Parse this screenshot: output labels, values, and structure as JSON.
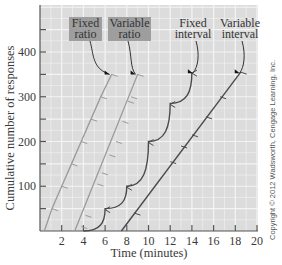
{
  "chart_data": {
    "type": "line",
    "title": "",
    "xlabel": "Time (minutes)",
    "ylabel": "Cumulative number of responses",
    "xlim": [
      0,
      20
    ],
    "ylim": [
      0,
      500
    ],
    "xticks": [
      2,
      4,
      6,
      8,
      10,
      12,
      14,
      16,
      18,
      20
    ],
    "yticks": [
      100,
      200,
      300,
      400
    ],
    "yticks_minor": [
      50,
      150,
      250,
      350,
      450
    ],
    "grid": true,
    "legend_position": "top-inside, labels with arrows",
    "series": [
      {
        "name": "Fixed ratio",
        "color": "#9a9a9a",
        "label_box": true,
        "points": [
          [
            0.4,
            0
          ],
          [
            1.1,
            50
          ],
          [
            2.0,
            100
          ],
          [
            2.9,
            150
          ],
          [
            3.8,
            200
          ],
          [
            4.7,
            250
          ],
          [
            5.6,
            300
          ],
          [
            6.6,
            350
          ]
        ],
        "reinforcement_marks": [
          [
            1.1,
            50
          ],
          [
            2.0,
            100
          ],
          [
            2.9,
            150
          ],
          [
            3.8,
            200
          ],
          [
            4.7,
            250
          ],
          [
            5.6,
            300
          ],
          [
            6.6,
            350
          ]
        ]
      },
      {
        "name": "Variable ratio",
        "color": "#9a9a9a",
        "label_box": true,
        "points": [
          [
            3.2,
            0
          ],
          [
            9.0,
            350
          ]
        ],
        "reinforcement_marks": [
          [
            3.8,
            10
          ],
          [
            4.2,
            35
          ],
          [
            5.3,
            105
          ],
          [
            5.7,
            130
          ],
          [
            6.4,
            170
          ],
          [
            7.0,
            200
          ],
          [
            7.6,
            245
          ],
          [
            8.1,
            290
          ],
          [
            8.4,
            300
          ],
          [
            9.0,
            350
          ]
        ]
      },
      {
        "name": "Fixed interval",
        "color": "#4a4a4a",
        "label_box": false,
        "points": [
          [
            4.0,
            0
          ],
          [
            6.0,
            50
          ],
          [
            8.0,
            100
          ],
          [
            10.0,
            200
          ],
          [
            12.0,
            285
          ],
          [
            14.0,
            355
          ]
        ],
        "reinforcement_marks": [
          [
            6.0,
            50
          ],
          [
            8.0,
            100
          ],
          [
            10.0,
            200
          ],
          [
            12.0,
            285
          ],
          [
            14.0,
            355
          ]
        ]
      },
      {
        "name": "Variable interval",
        "color": "#4a4a4a",
        "label_box": false,
        "points": [
          [
            7.5,
            0
          ],
          [
            18.5,
            355
          ]
        ],
        "reinforcement_marks": [
          [
            8.7,
            40
          ],
          [
            12.0,
            155
          ],
          [
            13.0,
            190
          ],
          [
            14.0,
            215
          ],
          [
            15.3,
            255
          ],
          [
            16.6,
            300
          ],
          [
            18.5,
            355
          ]
        ]
      }
    ],
    "annotations": [
      "Copyright © 2012 Wadsworth, Cengage Learning, Inc."
    ]
  },
  "copyright": "Copyright © 2012 Wadsworth, Cengage Learning, Inc."
}
